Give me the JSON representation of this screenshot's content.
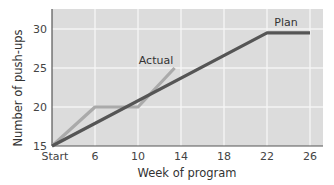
{
  "chart_data": {
    "type": "line",
    "title": "",
    "xlabel": "Week of program",
    "ylabel": "Number of push-ups",
    "x_tick_labels": [
      "Start",
      "6",
      "10",
      "14",
      "18",
      "22",
      "26"
    ],
    "x_tick_values": [
      2,
      6,
      10,
      14,
      18,
      22,
      26
    ],
    "y_ticks": [
      15,
      20,
      25,
      30
    ],
    "xlim": [
      2,
      27
    ],
    "ylim": [
      15,
      32
    ],
    "grid": true,
    "legend": "inline labels",
    "series": [
      {
        "name": "Plan",
        "color": "#555555",
        "points": [
          {
            "x": 2,
            "x_label": "Start",
            "y": 15
          },
          {
            "x": 22,
            "y": 29.5
          },
          {
            "x": 26,
            "y": 29.5
          }
        ]
      },
      {
        "name": "Actual",
        "color": "#aaaaaa",
        "points": [
          {
            "x": 2,
            "x_label": "Start",
            "y": 15
          },
          {
            "x": 6,
            "y": 20
          },
          {
            "x": 10,
            "y": 20
          },
          {
            "x": 13.4,
            "y": 25
          }
        ]
      }
    ]
  },
  "colors": {
    "plot_background": "#dcdcdc",
    "gridline": "#f4f4f4",
    "axis": "#555555"
  }
}
